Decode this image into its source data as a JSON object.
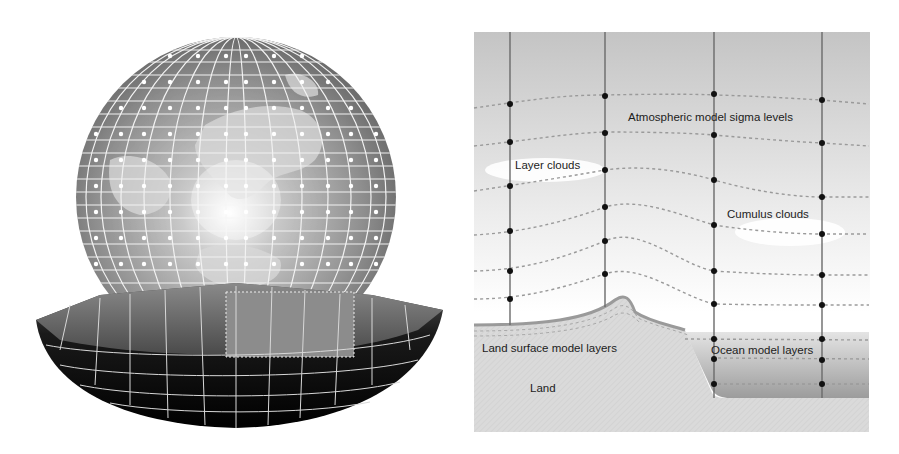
{
  "left_panel": {
    "name": "global-grid-globe",
    "description": "Globe with latitude-longitude grid points and cut-away base showing vertical model layers"
  },
  "right_panel": {
    "name": "model-cross-section",
    "labels": {
      "sigma": "Atmospheric model sigma levels",
      "layer_clouds": "Layer clouds",
      "cumulus": "Cumulus clouds",
      "land_layers": "Land surface model layers",
      "ocean_layers": "Ocean model layers",
      "land": "Land"
    }
  },
  "colors": {
    "sky_top": "#c8c8c8",
    "sky_bottom": "#ffffff",
    "land": "#d9d9d9",
    "ocean": "#a9a9a9",
    "grid_line": "#666666",
    "grid_point": "#111111"
  }
}
